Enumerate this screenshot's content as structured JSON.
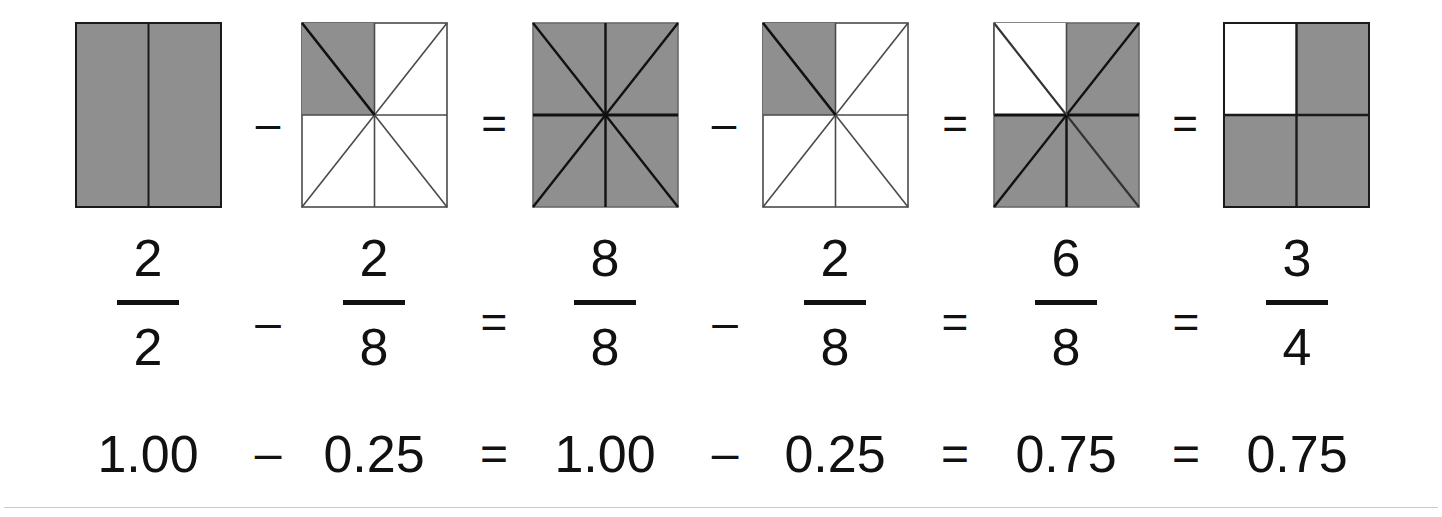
{
  "page": {
    "background_color": "#ffffff",
    "shade_color": "#8f8f8f",
    "line_color": "#1a1a1a",
    "rule_color": "#c9c9cf"
  },
  "diagrams": [
    {
      "name": "square-1",
      "divisions": 2,
      "division_style": "vertical-halves",
      "shaded_parts": 2,
      "total_parts": 2,
      "shaded_regions": [
        "left-half",
        "right-half"
      ],
      "label": "2/2 fully shaded"
    },
    {
      "name": "square-2",
      "divisions": 8,
      "division_style": "eighths-diagonals-and-midlines",
      "shaded_parts": 2,
      "total_parts": 8,
      "shaded_regions": [
        "top-left-quadrant"
      ],
      "label": "2/8 shaded in top-left quadrant"
    },
    {
      "name": "square-3",
      "divisions": 8,
      "division_style": "eighths-diagonals-and-midlines",
      "shaded_parts": 8,
      "total_parts": 8,
      "shaded_regions": [
        "all"
      ],
      "label": "8/8 fully shaded"
    },
    {
      "name": "square-4",
      "divisions": 8,
      "division_style": "eighths-diagonals-and-midlines",
      "shaded_parts": 2,
      "total_parts": 8,
      "shaded_regions": [
        "top-left-quadrant"
      ],
      "label": "2/8 shaded in top-left quadrant"
    },
    {
      "name": "square-5",
      "divisions": 8,
      "division_style": "eighths-diagonals-and-midlines",
      "shaded_parts": 6,
      "total_parts": 8,
      "shaded_regions": [
        "top-right-quadrant",
        "bottom-left-quadrant",
        "bottom-right-quadrant"
      ],
      "label": "6/8 shaded, top-left quadrant white"
    },
    {
      "name": "square-6",
      "divisions": 4,
      "division_style": "quarters-midlines",
      "shaded_parts": 3,
      "total_parts": 4,
      "shaded_regions": [
        "top-right-quadrant",
        "bottom-left-quadrant",
        "bottom-right-quadrant"
      ],
      "label": "3/4 shaded, top-left quadrant white"
    }
  ],
  "diagram_operators": [
    {
      "name": "minus-1",
      "symbol": "–"
    },
    {
      "name": "equals-1",
      "symbol": "="
    },
    {
      "name": "minus-2",
      "symbol": "–"
    },
    {
      "name": "equals-2",
      "symbol": "="
    },
    {
      "name": "equals-3",
      "symbol": "="
    }
  ],
  "fractions": [
    {
      "name": "fraction-1",
      "numerator": "2",
      "denominator": "2"
    },
    {
      "name": "fraction-2",
      "numerator": "2",
      "denominator": "8"
    },
    {
      "name": "fraction-3",
      "numerator": "8",
      "denominator": "8"
    },
    {
      "name": "fraction-4",
      "numerator": "2",
      "denominator": "8"
    },
    {
      "name": "fraction-5",
      "numerator": "6",
      "denominator": "8"
    },
    {
      "name": "fraction-6",
      "numerator": "3",
      "denominator": "4"
    }
  ],
  "fraction_operators": [
    {
      "name": "minus-1",
      "symbol": "–"
    },
    {
      "name": "equals-1",
      "symbol": "="
    },
    {
      "name": "minus-2",
      "symbol": "–"
    },
    {
      "name": "equals-2",
      "symbol": "="
    },
    {
      "name": "equals-3",
      "symbol": "="
    }
  ],
  "decimals": [
    {
      "name": "decimal-1",
      "value": "1.00"
    },
    {
      "name": "decimal-2",
      "value": "0.25"
    },
    {
      "name": "decimal-3",
      "value": "1.00"
    },
    {
      "name": "decimal-4",
      "value": "0.25"
    },
    {
      "name": "decimal-5",
      "value": "0.75"
    },
    {
      "name": "decimal-6",
      "value": "0.75"
    }
  ],
  "decimal_operators": [
    {
      "name": "minus-1",
      "symbol": "–"
    },
    {
      "name": "equals-1",
      "symbol": "="
    },
    {
      "name": "minus-2",
      "symbol": "–"
    },
    {
      "name": "equals-2",
      "symbol": "="
    },
    {
      "name": "equals-3",
      "symbol": "="
    }
  ],
  "equation": {
    "fraction_form": "2/2 – 2/8 = 8/8 – 2/8 = 6/8 = 3/4",
    "decimal_form": "1.00 – 0.25 = 1.00 – 0.25 = 0.75 = 0.75"
  }
}
